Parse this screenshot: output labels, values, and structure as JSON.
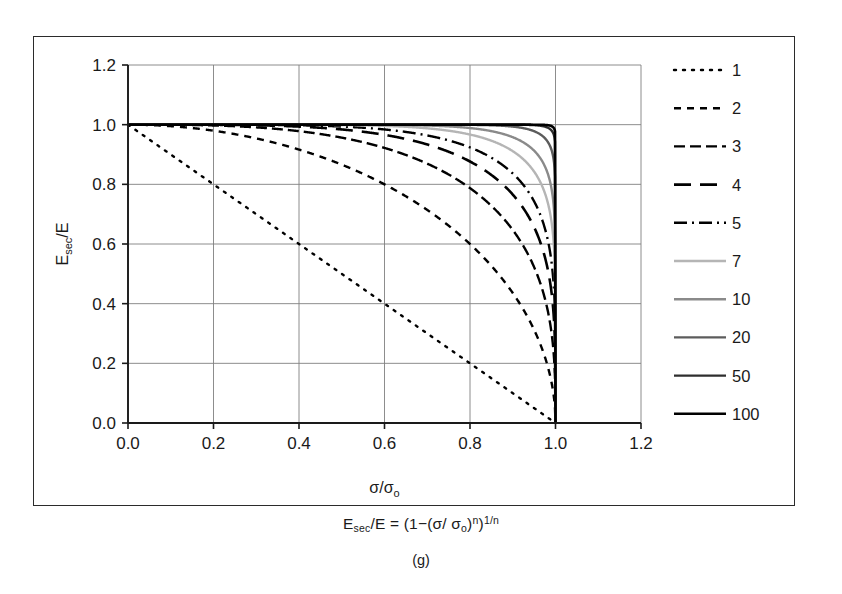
{
  "figure": {
    "equation": {
      "lhs_base": "E",
      "lhs_sub": "sec",
      "lhs_rest": "/E = (1−(σ/ σ",
      "rhs_sub_o": "o",
      "rhs_close": ")",
      "rhs_sup_n": "n",
      "rhs_close2": ")",
      "rhs_sup_inv": "1/n",
      "full": "E_sec/E = (1−(σ/ σ_o)^n)^(1/n)"
    },
    "panel_caption": "(g)"
  },
  "chart_data": {
    "type": "line",
    "title": "",
    "subtitle": "",
    "xlabel": "σ/σ_o",
    "ylabel": "E_sec/E",
    "xlabel_base": "σ/σ",
    "xlabel_sub": "o",
    "ylabel_base": "E",
    "ylabel_sub": "sec",
    "ylabel_rest": "/E",
    "xlim": [
      0.0,
      1.2
    ],
    "ylim": [
      0.0,
      1.2
    ],
    "xticks": [
      "0.0",
      "0.2",
      "0.4",
      "0.6",
      "0.8",
      "1.0",
      "1.2"
    ],
    "xtick_values": [
      0.0,
      0.2,
      0.4,
      0.6,
      0.8,
      1.0,
      1.2
    ],
    "yticks": [
      "0.0",
      "0.2",
      "0.4",
      "0.6",
      "0.8",
      "1.0",
      "1.2"
    ],
    "ytick_values": [
      0.0,
      0.2,
      0.4,
      0.6,
      0.8,
      1.0,
      1.2
    ],
    "grid": true,
    "grid_color": "#808080",
    "legend_position": "right",
    "equation_form": "y = (1 - x^n)^(1/n)",
    "legend_title": "",
    "series": [
      {
        "name": "1",
        "n": 1,
        "color": "#000000",
        "dash": "2,7",
        "width": 2.4,
        "cap": "round"
      },
      {
        "name": "2",
        "n": 2,
        "color": "#000000",
        "dash": "7,6",
        "width": 2.4,
        "cap": "butt"
      },
      {
        "name": "3",
        "n": 3,
        "color": "#000000",
        "dash": "11,5",
        "width": 2.4,
        "cap": "butt"
      },
      {
        "name": "4",
        "n": 4,
        "color": "#000000",
        "dash": "17,9",
        "width": 2.6,
        "cap": "butt"
      },
      {
        "name": "5",
        "n": 5,
        "color": "#000000",
        "dash": "13,5,2,5",
        "width": 2.4,
        "cap": "butt"
      },
      {
        "name": "7",
        "n": 7,
        "color": "#b5b5b5",
        "dash": "0",
        "width": 2.4,
        "cap": "butt"
      },
      {
        "name": "10",
        "n": 10,
        "color": "#8a8a8a",
        "dash": "0",
        "width": 2.4,
        "cap": "butt"
      },
      {
        "name": "20",
        "n": 20,
        "color": "#5c5c5c",
        "dash": "0",
        "width": 2.4,
        "cap": "butt"
      },
      {
        "name": "50",
        "n": 50,
        "color": "#2e2e2e",
        "dash": "0",
        "width": 2.4,
        "cap": "butt"
      },
      {
        "name": "100",
        "n": 100,
        "color": "#000000",
        "dash": "0",
        "width": 2.6,
        "cap": "butt"
      }
    ]
  }
}
